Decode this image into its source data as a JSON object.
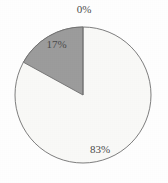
{
  "chart_data": {
    "type": "pie",
    "title": "",
    "xlabel": "",
    "ylabel": "",
    "legend": "none",
    "grid": false,
    "labels_shown_on_slices": true,
    "categories": [
      "Slice A",
      "Slice B",
      "Slice C"
    ],
    "values": [
      83,
      17,
      0
    ],
    "value_labels": [
      "83%",
      "17%",
      "0%"
    ],
    "slices": [
      {
        "label": "0%",
        "value": 0,
        "percent": 0,
        "color": "#f9f9f7",
        "start_angle_deg": 0,
        "end_angle_deg": 0,
        "label_position": "top"
      },
      {
        "label": "17%",
        "value": 17,
        "percent": 17,
        "color": "#9c9c9c",
        "start_angle_deg": 0,
        "end_angle_deg": -70,
        "label_position": "upper-left"
      },
      {
        "label": "83%",
        "value": 83,
        "percent": 83,
        "color": "#f9f9f7",
        "start_angle_deg": 0,
        "end_angle_deg": 290,
        "label_position": "lower-right"
      }
    ],
    "geometry": {
      "center_x": 83,
      "center_y": 95,
      "radius": 68
    },
    "colors": {
      "gray_slice": "#9c9c9c",
      "light_slice": "#f9f9f7",
      "outline": "#6f6f6f",
      "label_text": "#4a4a4a",
      "background": "#fefefe"
    }
  }
}
